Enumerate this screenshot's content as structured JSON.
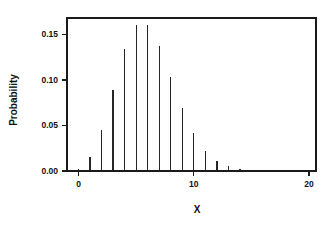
{
  "figure": {
    "background_color": "#ffffff",
    "ink_color": "#1a1a1a",
    "stem_color": "#262626"
  },
  "chart_data": {
    "type": "bar",
    "title": "",
    "subtitle": "",
    "xlabel": "X",
    "ylabel": "Probability",
    "xlim": [
      -1,
      20.6
    ],
    "ylim": [
      0.0,
      0.168
    ],
    "grid": false,
    "legend": null,
    "style": "stem-plot with thin vertical lines, no markers",
    "x_ticks": [
      0,
      10,
      20
    ],
    "x_tick_labels": [
      "0",
      "10",
      "20"
    ],
    "y_ticks": [
      0.0,
      0.05,
      0.1,
      0.15
    ],
    "y_tick_labels": [
      "0.00",
      "0.05",
      "0.10",
      "0.15"
    ],
    "categories": [
      0,
      1,
      2,
      3,
      4,
      5,
      6,
      7,
      8,
      9,
      10,
      11,
      12,
      13,
      14,
      15,
      16,
      17,
      18,
      19
    ],
    "values": [
      0.0025,
      0.0149,
      0.0446,
      0.0892,
      0.1339,
      0.1606,
      0.1606,
      0.1377,
      0.1033,
      0.0688,
      0.0413,
      0.0225,
      0.0113,
      0.0052,
      0.0022,
      0.0009,
      0.0003,
      0.0001,
      0.0001,
      0.0001
    ],
    "annotations": []
  },
  "axes": {
    "x_axis_label": "X",
    "y_axis_label": "Probability"
  }
}
